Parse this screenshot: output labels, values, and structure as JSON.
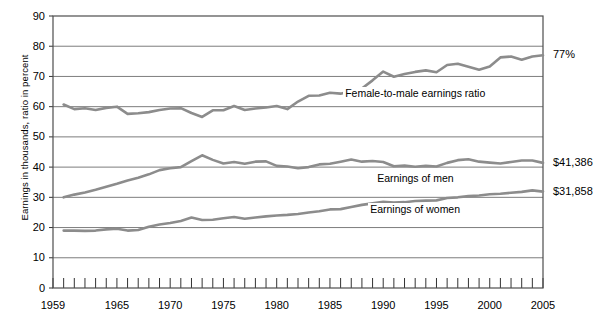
{
  "chart_data": {
    "type": "line",
    "title": "",
    "subtitle": "",
    "xlabel": "",
    "ylabel": "Earnings in thousands, ratio in percent",
    "xlim": [
      1959,
      2005
    ],
    "ylim": [
      0,
      90
    ],
    "yticks": [
      0,
      10,
      20,
      30,
      40,
      50,
      60,
      70,
      80,
      90
    ],
    "xticks": [
      1959,
      1965,
      1970,
      1975,
      1980,
      1985,
      1990,
      1995,
      2000,
      2005
    ],
    "xtick_labels": [
      "1959",
      "1965",
      "1970",
      "1975",
      "1980",
      "1985",
      "1990",
      "1995",
      "2000",
      "2005"
    ],
    "minor_xticks_every": 1,
    "grid": "horizontal",
    "legend": "inline-annotations",
    "line_color": "#8c8c8c",
    "grid_color": "#6e6e6e",
    "border_color": "#4d4d4d",
    "x": [
      1960,
      1961,
      1962,
      1963,
      1964,
      1965,
      1966,
      1967,
      1968,
      1969,
      1970,
      1971,
      1972,
      1973,
      1974,
      1975,
      1976,
      1977,
      1978,
      1979,
      1980,
      1981,
      1982,
      1983,
      1984,
      1985,
      1986,
      1987,
      1988,
      1989,
      1990,
      1991,
      1992,
      1993,
      1994,
      1995,
      1996,
      1997,
      1998,
      1999,
      2000,
      2001,
      2002,
      2003,
      2004,
      2005
    ],
    "series": [
      {
        "name": "Female-to-male earnings ratio",
        "label": "Female-to-male earnings ratio",
        "unit": "percent",
        "end_label": "77%",
        "values": [
          60.7,
          59.2,
          59.5,
          58.9,
          59.6,
          60.0,
          57.6,
          57.8,
          58.2,
          58.9,
          59.4,
          59.5,
          57.9,
          56.6,
          58.8,
          58.8,
          60.2,
          58.9,
          59.4,
          59.7,
          60.2,
          59.2,
          61.7,
          63.6,
          63.7,
          64.6,
          64.3,
          65.2,
          66.0,
          68.7,
          71.6,
          69.9,
          70.8,
          71.5,
          72.0,
          71.4,
          73.8,
          74.2,
          73.2,
          72.2,
          73.3,
          76.3,
          76.6,
          75.5,
          76.6,
          77.0
        ]
      },
      {
        "name": "Earnings of men",
        "label": "Earnings of men",
        "unit": "thousands of dollars",
        "end_label": "$41,386",
        "values": [
          30.0,
          30.9,
          31.6,
          32.5,
          33.5,
          34.5,
          35.6,
          36.5,
          37.6,
          39.0,
          39.6,
          40.0,
          42.0,
          43.9,
          42.4,
          41.2,
          41.7,
          41.1,
          41.8,
          41.9,
          40.4,
          40.2,
          39.6,
          40.0,
          40.9,
          41.1,
          41.8,
          42.5,
          41.8,
          42.0,
          41.7,
          40.3,
          40.5,
          40.1,
          40.4,
          40.2,
          41.4,
          42.3,
          42.6,
          41.8,
          41.5,
          41.2,
          41.7,
          42.2,
          42.2,
          41.4
        ]
      },
      {
        "name": "Earnings of women",
        "label": "Earnings of women",
        "unit": "thousands of dollars",
        "end_label": "$31,858",
        "values": [
          19.0,
          19.0,
          18.9,
          19.0,
          19.4,
          19.6,
          19.0,
          19.2,
          20.3,
          21.0,
          21.5,
          22.2,
          23.3,
          22.5,
          22.6,
          23.1,
          23.5,
          22.9,
          23.3,
          23.7,
          24.0,
          24.2,
          24.5,
          25.0,
          25.4,
          26.0,
          26.1,
          26.8,
          27.5,
          28.0,
          28.5,
          28.3,
          28.4,
          28.8,
          28.9,
          29.0,
          29.8,
          30.0,
          30.4,
          30.6,
          31.0,
          31.2,
          31.5,
          31.8,
          32.3,
          31.9
        ]
      }
    ],
    "annotations": [
      {
        "text": "Female-to-male earnings ratio",
        "x": 1993,
        "y": 64.5
      },
      {
        "text": "Earnings of men",
        "x": 1993,
        "y": 36.5
      },
      {
        "text": "Earnings of women",
        "x": 1993,
        "y": 26.2
      },
      {
        "text": "77%",
        "position": "right-of-axis",
        "y": 77
      },
      {
        "text": "$41,386",
        "position": "right-of-axis",
        "y": 41.4
      },
      {
        "text": "$31,858",
        "position": "right-of-axis",
        "y": 31.9
      }
    ]
  }
}
